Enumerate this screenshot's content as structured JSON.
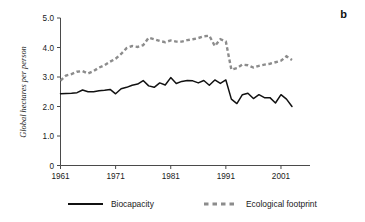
{
  "figure": {
    "panel_label": "b",
    "colors": {
      "biocapacity": "#111111",
      "footprint": "#8c8c8c",
      "axis": "#4a4a4a",
      "text": "#1a1a1a",
      "background": "#ffffff"
    }
  },
  "legend": {
    "position": "bottom",
    "items": [
      {
        "label": "Biocapacity",
        "style": "solid",
        "color": "#111111"
      },
      {
        "label": "Ecological footprint",
        "style": "dashed",
        "color": "#8c8c8c"
      }
    ]
  },
  "chart_data": {
    "type": "line",
    "title": "",
    "subtitle": "",
    "xlabel": "",
    "ylabel": "Global hectares per person",
    "xlim": [
      1961,
      2003
    ],
    "ylim": [
      0,
      5
    ],
    "grid": false,
    "legend_position": "bottom",
    "annotations": [
      "b"
    ],
    "xticks": [
      1961,
      1971,
      1981,
      1991,
      2001
    ],
    "xtick_labels": [
      "1961",
      "1971",
      "1981",
      "1991",
      "2001"
    ],
    "yticks": [
      0,
      1.0,
      2.0,
      3.0,
      4.0,
      5.0
    ],
    "ytick_labels": [
      "0",
      "1.0",
      "2.0",
      "3.0",
      "4.0",
      "5.0"
    ],
    "x": [
      1961,
      1962,
      1963,
      1964,
      1965,
      1966,
      1967,
      1968,
      1969,
      1970,
      1971,
      1972,
      1973,
      1974,
      1975,
      1976,
      1977,
      1978,
      1979,
      1980,
      1981,
      1982,
      1983,
      1984,
      1985,
      1986,
      1987,
      1988,
      1989,
      1990,
      1991,
      1992,
      1993,
      1994,
      1995,
      1996,
      1997,
      1998,
      1999,
      2000,
      2001,
      2002,
      2003
    ],
    "series": [
      {
        "name": "Biocapacity",
        "style": "solid",
        "color": "#111111",
        "values": [
          2.43,
          2.44,
          2.45,
          2.47,
          2.56,
          2.5,
          2.5,
          2.53,
          2.55,
          2.58,
          2.43,
          2.6,
          2.65,
          2.72,
          2.76,
          2.88,
          2.7,
          2.65,
          2.8,
          2.73,
          2.98,
          2.78,
          2.85,
          2.88,
          2.87,
          2.8,
          2.88,
          2.72,
          2.9,
          2.78,
          2.9,
          2.25,
          2.1,
          2.4,
          2.45,
          2.27,
          2.4,
          2.3,
          2.3,
          2.12,
          2.4,
          2.25,
          2.0
        ]
      },
      {
        "name": "Ecological footprint",
        "style": "dashed",
        "color": "#8c8c8c",
        "values": [
          2.88,
          3.05,
          3.1,
          3.18,
          3.2,
          3.12,
          3.2,
          3.32,
          3.4,
          3.52,
          3.62,
          3.78,
          3.98,
          4.05,
          4.02,
          4.08,
          4.33,
          4.28,
          4.22,
          4.18,
          4.24,
          4.2,
          4.2,
          4.25,
          4.28,
          4.32,
          4.38,
          4.4,
          4.05,
          4.28,
          4.2,
          3.25,
          3.3,
          3.42,
          3.4,
          3.32,
          3.38,
          3.42,
          3.45,
          3.5,
          3.55,
          3.7,
          3.58
        ]
      }
    ]
  }
}
